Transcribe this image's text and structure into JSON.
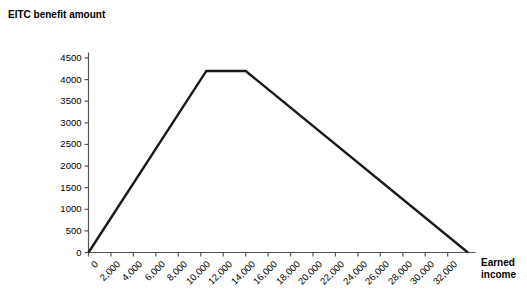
{
  "chart_data": {
    "type": "line",
    "title": "",
    "xlabel": "Earned income",
    "ylabel": "EITC benefit amount",
    "xlim": [
      0,
      33800
    ],
    "ylim": [
      0,
      4500
    ],
    "grid": false,
    "legend": "none",
    "x_ticks": [
      0,
      2000,
      4000,
      6000,
      8000,
      10000,
      12000,
      14000,
      16000,
      18000,
      20000,
      22000,
      24000,
      26000,
      28000,
      30000,
      32000
    ],
    "x_tick_labels": [
      "0",
      "2,000",
      "4,000",
      "6,000",
      "8,000",
      "10,000",
      "12,000",
      "14,000",
      "16,000",
      "18,000",
      "20,000",
      "22,000",
      "24,000",
      "26,000",
      "28,000",
      "30,000",
      "32,000"
    ],
    "y_ticks": [
      0,
      500,
      1000,
      1500,
      2000,
      2500,
      3000,
      3500,
      4000,
      4500
    ],
    "y_tick_labels": [
      "0",
      "500",
      "1000",
      "1500",
      "2000",
      "2500",
      "3000",
      "3500",
      "4000",
      "4500"
    ],
    "series": [
      {
        "name": "EITC benefit",
        "color": "#1a1a1a",
        "x": [
          0,
          10500,
          14000,
          33800
        ],
        "y": [
          0,
          4200,
          4200,
          0
        ]
      }
    ],
    "annotations": {
      "phase_in_region": "0 to 10,500",
      "plateau_region": "10,500 to 14,000",
      "phase_out_region": "14,000 to 33,800",
      "maximum_benefit": 4200
    }
  },
  "axis": {
    "y_title_line1": "EITC benefit",
    "y_title_line2": "amount",
    "x_title_line1": "Earned",
    "x_title_line2": "income"
  },
  "colors": {
    "line": "#1a1a1a",
    "axis": "#555555",
    "background": "#ffffff"
  }
}
